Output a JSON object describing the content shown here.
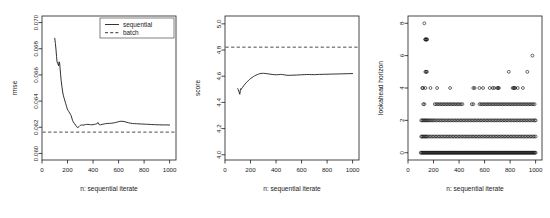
{
  "figure": {
    "panel_count": 3,
    "background": "#ffffff",
    "foreground": "#1a1a1a"
  },
  "chart_data": [
    {
      "type": "line",
      "panel_index": 0,
      "panel_name": "rmse-vs-iterate",
      "title": "",
      "xlabel": "n: sequential iterate",
      "ylabel": "rmse",
      "xlim": [
        0,
        1050
      ],
      "ylim": [
        0.0595,
        0.0705
      ],
      "xticks": [
        0,
        200,
        400,
        600,
        800,
        1000
      ],
      "xticklabels": [
        "0",
        "200",
        "400",
        "600",
        "800",
        "1000"
      ],
      "yticks": [
        0.06,
        0.062,
        0.064,
        0.066,
        0.068,
        0.07
      ],
      "yticklabels": [
        "0.060",
        "0.062",
        "0.064",
        "0.066",
        "0.068",
        "0.070"
      ],
      "grid": false,
      "legend": {
        "position": "top-right",
        "entries": [
          {
            "label": "sequential",
            "style": "solid"
          },
          {
            "label": "batch",
            "style": "dashed"
          }
        ]
      },
      "series": [
        {
          "name": "sequential",
          "style": "solid",
          "x": [
            100,
            105,
            110,
            114,
            118,
            122,
            126,
            130,
            134,
            138,
            142,
            146,
            150,
            156,
            162,
            168,
            174,
            180,
            186,
            192,
            198,
            204,
            210,
            216,
            222,
            228,
            234,
            240,
            246,
            252,
            258,
            264,
            270,
            276,
            282,
            290,
            300,
            310,
            320,
            330,
            340,
            350,
            360,
            370,
            380,
            390,
            400,
            410,
            420,
            430,
            440,
            446,
            452,
            460,
            470,
            480,
            490,
            500,
            515,
            530,
            545,
            560,
            575,
            590,
            605,
            620,
            635,
            650,
            665,
            680,
            695,
            710,
            725,
            740,
            760,
            780,
            800,
            820,
            840,
            860,
            880,
            900,
            920,
            940,
            960,
            980,
            1000
          ],
          "y": [
            0.0688,
            0.0684,
            0.0679,
            0.0674,
            0.067,
            0.0669,
            0.0668,
            0.0667,
            0.067,
            0.0669,
            0.0665,
            0.066,
            0.0656,
            0.0651,
            0.0647,
            0.0644,
            0.0642,
            0.064,
            0.0638,
            0.0636,
            0.0634,
            0.0633,
            0.0632,
            0.0631,
            0.063,
            0.0629,
            0.0627,
            0.0625,
            0.0624,
            0.0623,
            0.06225,
            0.06215,
            0.06205,
            0.062,
            0.06198,
            0.06205,
            0.06215,
            0.06218,
            0.06216,
            0.06218,
            0.0622,
            0.06222,
            0.06222,
            0.06221,
            0.0622,
            0.06219,
            0.0622,
            0.06222,
            0.06224,
            0.06228,
            0.06236,
            0.06224,
            0.06218,
            0.06219,
            0.06222,
            0.06224,
            0.06226,
            0.06228,
            0.06229,
            0.0623,
            0.06231,
            0.06233,
            0.06236,
            0.0624,
            0.06244,
            0.06246,
            0.06245,
            0.06242,
            0.06238,
            0.06234,
            0.06231,
            0.06229,
            0.06228,
            0.06227,
            0.06226,
            0.06225,
            0.06224,
            0.06223,
            0.06222,
            0.06221,
            0.0622,
            0.06219,
            0.06219,
            0.06218,
            0.06218,
            0.06218,
            0.06217
          ]
        },
        {
          "name": "batch",
          "style": "dashed",
          "constant_y": 0.06163
        }
      ]
    },
    {
      "type": "line",
      "panel_index": 1,
      "panel_name": "score-vs-iterate",
      "title": "",
      "xlabel": "n: sequential iterate",
      "ylabel": "score",
      "xlim": [
        0,
        1050
      ],
      "ylim": [
        3.96,
        5.06
      ],
      "xticks": [
        0,
        200,
        400,
        600,
        800,
        1000
      ],
      "xticklabels": [
        "0",
        "200",
        "400",
        "600",
        "800",
        "1000"
      ],
      "yticks": [
        4.0,
        4.2,
        4.4,
        4.6,
        4.8,
        5.0
      ],
      "yticklabels": [
        "4.0",
        "4.2",
        "4.4",
        "4.6",
        "4.8",
        "5.0"
      ],
      "grid": false,
      "legend": null,
      "series": [
        {
          "name": "sequential",
          "style": "solid",
          "x": [
            100,
            104,
            108,
            112,
            116,
            120,
            124,
            128,
            132,
            136,
            140,
            146,
            152,
            158,
            164,
            170,
            178,
            186,
            194,
            202,
            212,
            222,
            232,
            242,
            252,
            262,
            272,
            282,
            292,
            302,
            315,
            330,
            345,
            360,
            375,
            390,
            405,
            420,
            435,
            450,
            465,
            480,
            495,
            510,
            525,
            540,
            560,
            580,
            600,
            620,
            640,
            660,
            680,
            700,
            720,
            740,
            760,
            780,
            800,
            820,
            840,
            860,
            880,
            900,
            920,
            940,
            960,
            980,
            1000
          ],
          "y": [
            4.505,
            4.497,
            4.487,
            4.474,
            4.462,
            4.49,
            4.505,
            4.5,
            4.508,
            4.512,
            4.518,
            4.527,
            4.534,
            4.541,
            4.548,
            4.554,
            4.562,
            4.57,
            4.577,
            4.583,
            4.59,
            4.597,
            4.603,
            4.608,
            4.612,
            4.616,
            4.619,
            4.621,
            4.622,
            4.622,
            4.621,
            4.619,
            4.617,
            4.615,
            4.613,
            4.612,
            4.611,
            4.612,
            4.614,
            4.613,
            4.61,
            4.608,
            4.607,
            4.607,
            4.608,
            4.608,
            4.609,
            4.61,
            4.611,
            4.612,
            4.613,
            4.613,
            4.612,
            4.612,
            4.613,
            4.614,
            4.614,
            4.615,
            4.615,
            4.616,
            4.616,
            4.617,
            4.617,
            4.618,
            4.618,
            4.619,
            4.619,
            4.62,
            4.62
          ]
        },
        {
          "name": "batch",
          "style": "dashed",
          "constant_y": 4.822
        }
      ]
    },
    {
      "type": "scatter",
      "panel_index": 2,
      "panel_name": "lookahead-horizon-vs-iterate",
      "title": "",
      "xlabel": "n: sequential iterate",
      "ylabel": "lookahead horizon",
      "xlim": [
        0,
        1050
      ],
      "ylim": [
        -0.45,
        8.45
      ],
      "xticks": [
        0,
        200,
        400,
        600,
        800,
        1000
      ],
      "xticklabels": [
        "0",
        "200",
        "400",
        "600",
        "800",
        "1000"
      ],
      "yticks": [
        0,
        2,
        4,
        6,
        8
      ],
      "yticklabels": [
        "0",
        "2",
        "4",
        "6",
        "8"
      ],
      "grid": false,
      "legend": null,
      "marker": "open-circle",
      "rows": [
        {
          "y": 8,
          "x": [
            128
          ]
        },
        {
          "y": 7,
          "x": [
            134,
            138,
            142,
            146,
            150
          ]
        },
        {
          "y": 6,
          "x": [
            975
          ]
        },
        {
          "y": 5,
          "x": [
            136,
            142,
            148,
            790,
            935
          ]
        },
        {
          "y": 4,
          "x": [
            112,
            118,
            136,
            176,
            228,
            330,
            512,
            522,
            560,
            588,
            640,
            664,
            676,
            700,
            706,
            712,
            820,
            828,
            834,
            840,
            860,
            900
          ]
        },
        {
          "y": 3,
          "x": [
            120,
            128,
            210,
            222,
            234,
            246,
            258,
            270,
            282,
            294,
            306,
            318,
            330,
            342,
            354,
            366,
            378,
            390,
            402,
            414,
            426,
            500,
            512,
            560,
            572,
            584,
            596,
            608,
            620,
            632,
            644,
            656,
            668,
            680,
            692,
            704,
            716,
            728,
            740,
            752,
            764,
            776,
            788,
            800,
            812,
            824,
            836,
            848,
            860,
            872,
            884,
            896,
            908,
            920,
            932,
            944,
            956,
            968,
            980,
            992
          ]
        },
        {
          "y": 2,
          "x": [
            104,
            112,
            120,
            128,
            136,
            144,
            152,
            160,
            170,
            180,
            190,
            200,
            212,
            224,
            236,
            248,
            260,
            272,
            284,
            296,
            308,
            320,
            332,
            344,
            356,
            368,
            380,
            392,
            404,
            416,
            428,
            440,
            452,
            464,
            476,
            488,
            500,
            512,
            524,
            536,
            548,
            560,
            572,
            584,
            596,
            608,
            620,
            632,
            644,
            656,
            668,
            680,
            692,
            704,
            716,
            728,
            740,
            752,
            764,
            776,
            788,
            800,
            812,
            824,
            836,
            848,
            860,
            872,
            884,
            896,
            908,
            920,
            932,
            944,
            956,
            968,
            980,
            992,
            1000
          ]
        },
        {
          "y": 1,
          "x": [
            104,
            110,
            118,
            126,
            134,
            142,
            150,
            160,
            172,
            184,
            196,
            208,
            220,
            232,
            244,
            256,
            268,
            280,
            292,
            304,
            316,
            328,
            340,
            352,
            364,
            376,
            388,
            400,
            412,
            424,
            436,
            448,
            460,
            472,
            484,
            496,
            508,
            520,
            532,
            544,
            556,
            568,
            580,
            592,
            604,
            616,
            628,
            640,
            652,
            664,
            676,
            688,
            700,
            712,
            724,
            736,
            748,
            760,
            772,
            784,
            796,
            808,
            820,
            832,
            844,
            856,
            868,
            880,
            892,
            904,
            916,
            928,
            940,
            952,
            964,
            976,
            988,
            1000
          ]
        },
        {
          "y": 0,
          "x": [
            100,
            106,
            112,
            118,
            124,
            130,
            136,
            142,
            148,
            154,
            160,
            166,
            172,
            178,
            184,
            190,
            196,
            202,
            208,
            214,
            220,
            226,
            232,
            238,
            244,
            250,
            256,
            262,
            268,
            274,
            280,
            286,
            292,
            298,
            304,
            310,
            316,
            322,
            328,
            334,
            340,
            346,
            352,
            358,
            364,
            370,
            376,
            382,
            388,
            394,
            400,
            406,
            412,
            418,
            424,
            430,
            436,
            442,
            448,
            454,
            460,
            466,
            472,
            478,
            484,
            490,
            496,
            502,
            508,
            514,
            520,
            526,
            532,
            538,
            544,
            550,
            556,
            562,
            568,
            574,
            580,
            586,
            592,
            598,
            604,
            610,
            616,
            622,
            628,
            634,
            640,
            646,
            652,
            658,
            664,
            670,
            676,
            682,
            688,
            694,
            700,
            706,
            712,
            718,
            724,
            730,
            736,
            742,
            748,
            754,
            760,
            766,
            772,
            778,
            784,
            790,
            796,
            802,
            808,
            814,
            820,
            826,
            832,
            838,
            844,
            850,
            856,
            862,
            868,
            874,
            880,
            886,
            892,
            898,
            904,
            910,
            916,
            922,
            928,
            934,
            940,
            946,
            952,
            958,
            964,
            970,
            976,
            982,
            988,
            994,
            1000
          ]
        }
      ]
    }
  ]
}
